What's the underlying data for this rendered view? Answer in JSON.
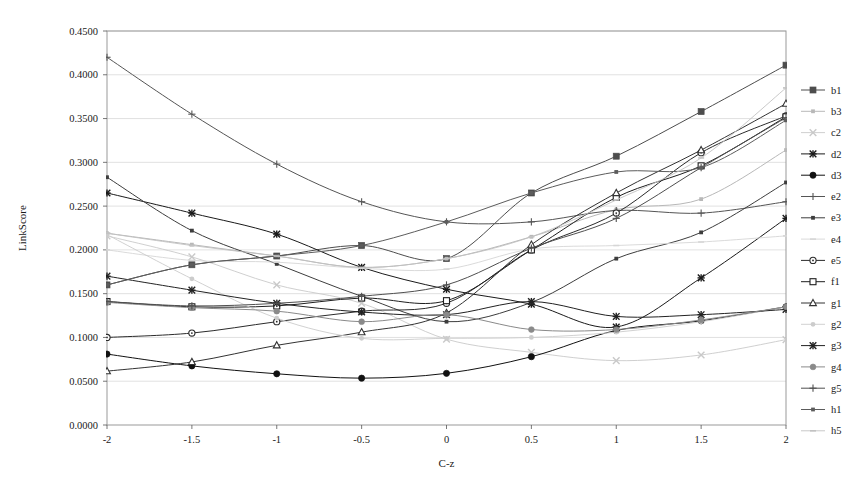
{
  "chart_data": {
    "type": "line",
    "title": "",
    "xlabel": "C-z",
    "ylabel": "LinkScore",
    "x": [
      -2,
      -1.5,
      -1,
      -0.5,
      0,
      0.5,
      1,
      1.5,
      2
    ],
    "xtick_labels": [
      "-2",
      "-1.5",
      "-1",
      "-0.5",
      "0",
      "0.5",
      "1",
      "1.5",
      "2"
    ],
    "ytick_labels": [
      "0.0000",
      "0.0500",
      "0.1000",
      "0.1500",
      "0.2000",
      "0.2500",
      "0.3000",
      "0.3500",
      "0.4000",
      "0.4500"
    ],
    "ytick_values": [
      0.0,
      0.05,
      0.1,
      0.15,
      0.2,
      0.25,
      0.3,
      0.35,
      0.4,
      0.45
    ],
    "ylim": [
      0.0,
      0.45
    ],
    "xlim": [
      -2,
      2
    ],
    "grid": true,
    "legend_position": "right",
    "series": [
      {
        "name": "b1",
        "marker": "square-filled",
        "color": "#4d4d4d",
        "values": [
          0.16,
          0.183,
          0.193,
          0.205,
          0.19,
          0.265,
          0.307,
          0.358,
          0.411
        ]
      },
      {
        "name": "b3",
        "marker": "dot-small",
        "color": "#b8b8b8",
        "values": [
          0.219,
          0.206,
          0.193,
          0.18,
          0.19,
          0.215,
          0.246,
          0.258,
          0.314
        ]
      },
      {
        "name": "c2",
        "marker": "x-light",
        "color": "#c9c9c9",
        "values": [
          0.216,
          0.192,
          0.16,
          0.139,
          0.098,
          0.083,
          0.0735,
          0.08,
          0.0975
        ]
      },
      {
        "name": "d2",
        "marker": "star",
        "color": "#1a1a1a",
        "values": [
          0.265,
          0.242,
          0.218,
          0.18,
          0.155,
          0.138,
          0.112,
          0.168,
          0.236
        ]
      },
      {
        "name": "d3",
        "marker": "circle-filled",
        "color": "#111111",
        "values": [
          0.081,
          0.0675,
          0.0585,
          0.0535,
          0.059,
          0.078,
          0.108,
          0.119,
          0.135
        ]
      },
      {
        "name": "e2",
        "marker": "plus",
        "color": "#555555",
        "values": [
          0.42,
          0.355,
          0.298,
          0.255,
          0.232,
          0.232,
          0.245,
          0.242,
          0.255
        ]
      },
      {
        "name": "e3",
        "marker": "dot-small",
        "color": "#3d3d3d",
        "values": [
          0.283,
          0.222,
          0.184,
          0.147,
          0.118,
          0.14,
          0.19,
          0.22,
          0.277
        ]
      },
      {
        "name": "e4",
        "marker": "line-light",
        "color": "#d6d6d6",
        "values": [
          0.2,
          0.188,
          0.186,
          0.179,
          0.178,
          0.201,
          0.205,
          0.209,
          0.216
        ]
      },
      {
        "name": "e5",
        "marker": "circle-open",
        "color": "#2b2b2b",
        "values": [
          0.1,
          0.105,
          0.118,
          0.13,
          0.139,
          0.2,
          0.242,
          0.311,
          0.353
        ]
      },
      {
        "name": "f1",
        "marker": "square-open",
        "color": "#1f1f1f",
        "values": [
          0.141,
          0.135,
          0.136,
          0.145,
          0.142,
          0.2,
          0.26,
          0.296,
          0.352
        ]
      },
      {
        "name": "g1",
        "marker": "triangle-open",
        "color": "#333333",
        "values": [
          0.0615,
          0.072,
          0.091,
          0.106,
          0.128,
          0.206,
          0.265,
          0.314,
          0.367
        ]
      },
      {
        "name": "g2",
        "marker": "dot-light",
        "color": "#cccccc",
        "values": [
          0.2175,
          0.167,
          0.122,
          0.099,
          0.099,
          0.1,
          0.106,
          0.118,
          0.135
        ]
      },
      {
        "name": "g3",
        "marker": "star",
        "color": "#222222",
        "values": [
          0.17,
          0.154,
          0.139,
          0.129,
          0.126,
          0.141,
          0.124,
          0.126,
          0.132
        ]
      },
      {
        "name": "g4",
        "marker": "circle-gray",
        "color": "#8a8a8a",
        "values": [
          0.14,
          0.134,
          0.13,
          0.118,
          0.126,
          0.109,
          0.109,
          0.12,
          0.135
        ]
      },
      {
        "name": "g5",
        "marker": "plus",
        "color": "#4f4f4f",
        "values": [
          0.141,
          0.136,
          0.139,
          0.147,
          0.16,
          0.202,
          0.236,
          0.294,
          0.351
        ]
      },
      {
        "name": "h1",
        "marker": "dot-small",
        "color": "#5c5c5c",
        "values": [
          0.16,
          0.183,
          0.193,
          0.205,
          0.232,
          0.265,
          0.289,
          0.294,
          0.348
        ]
      },
      {
        "name": "h5",
        "marker": "line-light",
        "color": "#c2c2c2",
        "values": [
          0.219,
          0.205,
          0.193,
          0.18,
          0.19,
          0.215,
          0.257,
          0.305,
          0.385
        ]
      }
    ]
  },
  "legend": {
    "entries": [
      "b1",
      "b3",
      "c2",
      "d2",
      "d3",
      "e2",
      "e3",
      "e4",
      "e5",
      "f1",
      "g1",
      "g2",
      "g3",
      "g4",
      "g5",
      "h1",
      "h5"
    ]
  }
}
